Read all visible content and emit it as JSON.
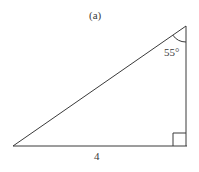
{
  "figure": {
    "label": "(a)",
    "shape": "right-triangle",
    "angle_label": "55°",
    "side_label": "4",
    "right_angle_marker": true,
    "colors": {
      "stroke": "#3a3a3a",
      "background": "#ffffff"
    }
  }
}
